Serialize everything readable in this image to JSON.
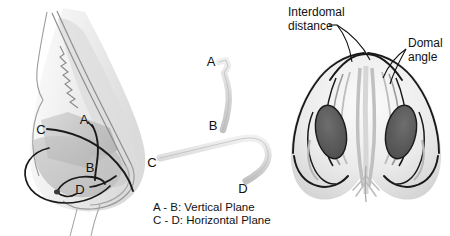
{
  "figure": {
    "background_color": "#ffffff"
  },
  "panels": {
    "lateral_profile": {
      "name": "Lateral nasal profile with alar cartilage planes",
      "point_labels": [
        {
          "id": "A",
          "text": "A"
        },
        {
          "id": "B",
          "text": "B"
        },
        {
          "id": "C",
          "text": "C"
        },
        {
          "id": "D",
          "text": "D"
        }
      ]
    },
    "cartilage_strips": {
      "name": "Isolated cartilage strips",
      "vertical_strip": {
        "start_label": "A",
        "end_label": "B"
      },
      "horizontal_strip": {
        "start_label": "C",
        "end_label": "D"
      }
    },
    "base_view": {
      "name": "Nasal base view",
      "callouts": [
        {
          "id": "interdomal-distance",
          "line1": "Interdomal",
          "line2": "distance"
        },
        {
          "id": "domal-angle",
          "line1": "Domal",
          "line2": "angle"
        }
      ]
    }
  },
  "legend": {
    "lines": [
      "A - B: Vertical Plane",
      "C - D: Horizontal Plane"
    ]
  },
  "colors": {
    "outline": "#111111",
    "skin_light": "#f0f0f0",
    "skin_mid": "#dcdcdc",
    "cartilage_shade": "#c9c9c9",
    "cartilage_dark": "#b4b4b4",
    "nostril": "#5a5a5a",
    "nostril_mid": "#8c8c8c",
    "text": "#111111",
    "background": "#ffffff"
  }
}
